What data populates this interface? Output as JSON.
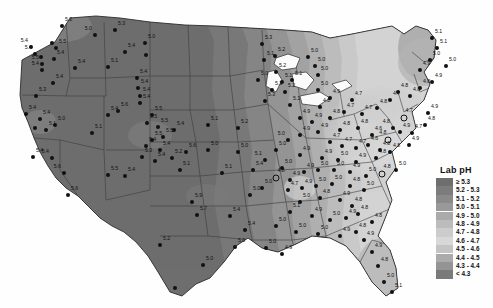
{
  "figure": {
    "type": "choropleth-contour-map",
    "region": "Contiguous United States",
    "variable": "Lab pH",
    "background_color": "#ffffff"
  },
  "legend": {
    "title": "Lab pH",
    "position": "right",
    "classes": [
      {
        "label": "≥ 5.3",
        "color": "#6e6e6e"
      },
      {
        "label": "5.2 - 5.3",
        "color": "#7c7c7c"
      },
      {
        "label": "5.1 - 5.2",
        "color": "#8a8a8a"
      },
      {
        "label": "5.0 - 5.1",
        "color": "#999999"
      },
      {
        "label": "4.9 - 5.0",
        "color": "#aaaaaa"
      },
      {
        "label": "4.8 - 4.9",
        "color": "#bcbcbc"
      },
      {
        "label": "4.7 - 4.8",
        "color": "#cccccc"
      },
      {
        "label": "4.6 - 4.7",
        "color": "#d8d8d8"
      },
      {
        "label": "4.5 - 4.6",
        "color": "#c4c4c4"
      },
      {
        "label": "4.4 - 4.5",
        "color": "#ababab"
      },
      {
        "label": "4.3 - 4.4",
        "color": "#949494"
      },
      {
        "label": "< 4.3",
        "color": "#7a7a7a"
      }
    ]
  },
  "chart_data": {
    "type": "map",
    "title": "Lab pH",
    "value_range": [
      4.3,
      5.3
    ],
    "marker_types": {
      "filled_dot": "monitoring station",
      "open_circle": "highlighted monitoring station"
    },
    "stations": [
      {
        "x": 31,
        "y": 47,
        "v": "5.4",
        "m": "dot",
        "p": "lf"
      },
      {
        "x": 35,
        "y": 54,
        "v": "5.4",
        "m": "dot",
        "p": "lf"
      },
      {
        "x": 41,
        "y": 57,
        "v": "",
        "m": "dot",
        "p": "r"
      },
      {
        "x": 62,
        "y": 26,
        "v": "5.2",
        "m": "dot",
        "p": "r"
      },
      {
        "x": 52,
        "y": 43,
        "v": "",
        "m": "dot",
        "p": "r"
      },
      {
        "x": 56,
        "y": 48,
        "v": "5.5",
        "m": "dot",
        "p": "r"
      },
      {
        "x": 54,
        "y": 59,
        "v": "5.4",
        "m": "dot",
        "p": "r"
      },
      {
        "x": 95,
        "y": 35,
        "v": "5.0",
        "m": "dot",
        "p": "lf"
      },
      {
        "x": 115,
        "y": 30,
        "v": "5.3",
        "m": "dot",
        "p": "r"
      },
      {
        "x": 145,
        "y": 43,
        "v": "5.0",
        "m": "dot",
        "p": "r"
      },
      {
        "x": 125,
        "y": 52,
        "v": "5.4",
        "m": "dot",
        "p": "r"
      },
      {
        "x": 146,
        "y": 55,
        "v": "",
        "m": "dot",
        "p": "r"
      },
      {
        "x": 42,
        "y": 64,
        "v": "5.5",
        "m": "dot",
        "p": "lf"
      },
      {
        "x": 42,
        "y": 70,
        "v": "5.4",
        "m": "dot",
        "p": "lf"
      },
      {
        "x": 75,
        "y": 68,
        "v": "5.4",
        "m": "dot",
        "p": "r"
      },
      {
        "x": 108,
        "y": 67,
        "v": "5.1",
        "m": "dot",
        "p": "r"
      },
      {
        "x": 53,
        "y": 83,
        "v": "5.4",
        "m": "dot",
        "p": "r"
      },
      {
        "x": 36,
        "y": 96,
        "v": "5.3",
        "m": "dot",
        "p": "r"
      },
      {
        "x": 137,
        "y": 78,
        "v": "5.4",
        "m": "dot",
        "p": "r"
      },
      {
        "x": 138,
        "y": 88,
        "v": "5.4",
        "m": "dot",
        "p": "r"
      },
      {
        "x": 140,
        "y": 96,
        "v": "5.4",
        "m": "dot",
        "p": "r"
      },
      {
        "x": 140,
        "y": 103,
        "v": "5.4",
        "m": "dot",
        "p": "r"
      },
      {
        "x": 26,
        "y": 114,
        "v": "5.4",
        "m": "dot",
        "p": "r"
      },
      {
        "x": 40,
        "y": 119,
        "v": "5.4",
        "m": "dot",
        "p": "r"
      },
      {
        "x": 35,
        "y": 128,
        "v": "",
        "m": "dot",
        "p": "r"
      },
      {
        "x": 46,
        "y": 130,
        "v": "5.1",
        "m": "dot",
        "p": "r"
      },
      {
        "x": 55,
        "y": 125,
        "v": "5.0",
        "m": "dot",
        "p": "r"
      },
      {
        "x": 33,
        "y": 157,
        "v": "5.4",
        "m": "dot",
        "p": "r"
      },
      {
        "x": 52,
        "y": 158,
        "v": "5.4",
        "m": "dot",
        "p": "lf"
      },
      {
        "x": 92,
        "y": 133,
        "v": "5.1",
        "m": "dot",
        "p": "r"
      },
      {
        "x": 108,
        "y": 175,
        "v": "5.5",
        "m": "dot",
        "p": "r"
      },
      {
        "x": 64,
        "y": 173,
        "v": "5.6",
        "m": "dot",
        "p": "lf"
      },
      {
        "x": 68,
        "y": 195,
        "v": "5.6",
        "m": "dot",
        "p": "r"
      },
      {
        "x": 108,
        "y": 115,
        "v": "5.4",
        "m": "dot",
        "p": "r"
      },
      {
        "x": 118,
        "y": 111,
        "v": "5.6",
        "m": "dot",
        "p": "r"
      },
      {
        "x": 152,
        "y": 115,
        "v": "5.5",
        "m": "dot",
        "p": "r"
      },
      {
        "x": 147,
        "y": 123,
        "v": "5.5",
        "m": "dot",
        "p": "r"
      },
      {
        "x": 158,
        "y": 127,
        "v": "5.5",
        "m": "dot",
        "p": "r"
      },
      {
        "x": 174,
        "y": 130,
        "v": "5.4",
        "m": "dot",
        "p": "r"
      },
      {
        "x": 163,
        "y": 137,
        "v": "5.5",
        "m": "dot",
        "p": "r"
      },
      {
        "x": 152,
        "y": 140,
        "v": "5.5",
        "m": "dot",
        "p": "r"
      },
      {
        "x": 146,
        "y": 146,
        "v": "5.4",
        "m": "dot",
        "p": "r"
      },
      {
        "x": 160,
        "y": 150,
        "v": "5.4",
        "m": "dot",
        "p": "r"
      },
      {
        "x": 142,
        "y": 157,
        "v": "5.3",
        "m": "dot",
        "p": "r"
      },
      {
        "x": 155,
        "y": 161,
        "v": "5.4",
        "m": "dot",
        "p": "r"
      },
      {
        "x": 172,
        "y": 158,
        "v": "5.2",
        "m": "dot",
        "p": "r"
      },
      {
        "x": 186,
        "y": 152,
        "v": "5.6",
        "m": "dot",
        "p": "r"
      },
      {
        "x": 208,
        "y": 125,
        "v": "5.1",
        "m": "dot",
        "p": "r"
      },
      {
        "x": 238,
        "y": 128,
        "v": "5.2",
        "m": "dot",
        "p": "r"
      },
      {
        "x": 208,
        "y": 150,
        "v": "5.0",
        "m": "dot",
        "p": "r"
      },
      {
        "x": 238,
        "y": 152,
        "v": "5.0",
        "m": "dot",
        "p": "r"
      },
      {
        "x": 125,
        "y": 176,
        "v": "5.4",
        "m": "dot",
        "p": "r"
      },
      {
        "x": 180,
        "y": 170,
        "v": "5.1",
        "m": "dot",
        "p": "r"
      },
      {
        "x": 222,
        "y": 173,
        "v": "5.1",
        "m": "dot",
        "p": "r"
      },
      {
        "x": 253,
        "y": 170,
        "v": "5.4",
        "m": "dot",
        "p": "r"
      },
      {
        "x": 250,
        "y": 195,
        "v": "5.0",
        "m": "dot",
        "p": "r"
      },
      {
        "x": 192,
        "y": 202,
        "v": "5.9",
        "m": "dot",
        "p": "r"
      },
      {
        "x": 197,
        "y": 215,
        "v": "5.7",
        "m": "dot",
        "p": "r"
      },
      {
        "x": 230,
        "y": 216,
        "v": "5.4",
        "m": "dot",
        "p": "r"
      },
      {
        "x": 245,
        "y": 230,
        "v": "5.4",
        "m": "dot",
        "p": "r"
      },
      {
        "x": 235,
        "y": 247,
        "v": "5.0",
        "m": "dot",
        "p": "r"
      },
      {
        "x": 203,
        "y": 265,
        "v": "5.0",
        "m": "dot",
        "p": "r"
      },
      {
        "x": 160,
        "y": 245,
        "v": "5.2",
        "m": "dot",
        "p": "r"
      },
      {
        "x": 175,
        "y": 288,
        "v": "",
        "m": "dot",
        "p": "r"
      },
      {
        "x": 262,
        "y": 44,
        "v": "5.3",
        "m": "dot",
        "p": "r"
      },
      {
        "x": 264,
        "y": 60,
        "v": "5.1",
        "m": "dot",
        "p": "r"
      },
      {
        "x": 275,
        "y": 56,
        "v": "5.2",
        "m": "dot",
        "p": "r"
      },
      {
        "x": 276,
        "y": 72,
        "v": "5.2",
        "m": "dot",
        "p": "r"
      },
      {
        "x": 282,
        "y": 82,
        "v": "5.1",
        "m": "dot",
        "p": "r"
      },
      {
        "x": 292,
        "y": 80,
        "v": "5.1",
        "m": "dot",
        "p": "r"
      },
      {
        "x": 258,
        "y": 80,
        "v": "5.0",
        "m": "dot",
        "p": "r"
      },
      {
        "x": 272,
        "y": 90,
        "v": "5.3",
        "m": "dot",
        "p": "r"
      },
      {
        "x": 285,
        "y": 92,
        "v": "5.2",
        "m": "dot",
        "p": "r"
      },
      {
        "x": 265,
        "y": 101,
        "v": "5.3",
        "m": "dot",
        "p": "r"
      },
      {
        "x": 290,
        "y": 105,
        "v": "5.1",
        "m": "dot",
        "p": "r"
      },
      {
        "x": 308,
        "y": 57,
        "v": "5.0",
        "m": "dot",
        "p": "r"
      },
      {
        "x": 315,
        "y": 66,
        "v": "5.0",
        "m": "dot",
        "p": "r"
      },
      {
        "x": 318,
        "y": 75,
        "v": "5.0",
        "m": "dot",
        "p": "r"
      },
      {
        "x": 318,
        "y": 90,
        "v": "5.0",
        "m": "dot",
        "p": "r"
      },
      {
        "x": 330,
        "y": 98,
        "v": "4.9",
        "m": "dot",
        "p": "r"
      },
      {
        "x": 320,
        "y": 107,
        "v": "4.8",
        "m": "dot",
        "p": "r"
      },
      {
        "x": 300,
        "y": 118,
        "v": "4.9",
        "m": "dot",
        "p": "r"
      },
      {
        "x": 312,
        "y": 122,
        "v": "4.9",
        "m": "dot",
        "p": "r"
      },
      {
        "x": 330,
        "y": 118,
        "v": "4.8",
        "m": "dot",
        "p": "r"
      },
      {
        "x": 352,
        "y": 100,
        "v": "4.7",
        "m": "dot",
        "p": "r"
      },
      {
        "x": 344,
        "y": 112,
        "v": "4.7",
        "m": "dot",
        "p": "r"
      },
      {
        "x": 362,
        "y": 114,
        "v": "4.7",
        "m": "dot",
        "p": "r"
      },
      {
        "x": 377,
        "y": 108,
        "v": "4.8",
        "m": "dot",
        "p": "r"
      },
      {
        "x": 390,
        "y": 100,
        "v": "4.7",
        "m": "dot",
        "p": "r"
      },
      {
        "x": 398,
        "y": 92,
        "v": "4.8",
        "m": "dot",
        "p": "r"
      },
      {
        "x": 410,
        "y": 96,
        "v": "4.8",
        "m": "dot",
        "p": "r"
      },
      {
        "x": 420,
        "y": 88,
        "v": "4.8",
        "m": "dot",
        "p": "r"
      },
      {
        "x": 432,
        "y": 82,
        "v": "4.9",
        "m": "dot",
        "p": "r"
      },
      {
        "x": 420,
        "y": 70,
        "v": "4.9",
        "m": "dot",
        "p": "r"
      },
      {
        "x": 430,
        "y": 60,
        "v": "5.0",
        "m": "dot",
        "p": "r"
      },
      {
        "x": 437,
        "y": 48,
        "v": "5.1",
        "m": "dot",
        "p": "r"
      },
      {
        "x": 432,
        "y": 38,
        "v": "5.1",
        "m": "dot",
        "p": "r"
      },
      {
        "x": 446,
        "y": 66,
        "v": "5.0",
        "m": "dot",
        "p": "r"
      },
      {
        "x": 404,
        "y": 118,
        "v": "4.7",
        "m": "ring",
        "p": "r"
      },
      {
        "x": 393,
        "y": 128,
        "v": "4.8",
        "m": "dot",
        "p": "lf"
      },
      {
        "x": 400,
        "y": 132,
        "v": "4.9",
        "m": "dot",
        "p": "r"
      },
      {
        "x": 388,
        "y": 140,
        "v": "4.8",
        "m": "ring",
        "p": "lf"
      },
      {
        "x": 380,
        "y": 150,
        "v": "4.8",
        "m": "dot",
        "p": "r"
      },
      {
        "x": 412,
        "y": 133,
        "v": "4.7",
        "m": "dot",
        "p": "r"
      },
      {
        "x": 425,
        "y": 125,
        "v": "4.8",
        "m": "dot",
        "p": "r"
      },
      {
        "x": 428,
        "y": 113,
        "v": "4.9",
        "m": "dot",
        "p": "r"
      },
      {
        "x": 300,
        "y": 135,
        "v": "4.9",
        "m": "dot",
        "p": "r"
      },
      {
        "x": 318,
        "y": 132,
        "v": "4.9",
        "m": "dot",
        "p": "r"
      },
      {
        "x": 340,
        "y": 130,
        "v": "4.8",
        "m": "dot",
        "p": "r"
      },
      {
        "x": 358,
        "y": 128,
        "v": "4.8",
        "m": "dot",
        "p": "r"
      },
      {
        "x": 372,
        "y": 135,
        "v": "4.6",
        "m": "dot",
        "p": "r"
      },
      {
        "x": 368,
        "y": 145,
        "v": "4.6",
        "m": "dot",
        "p": "r"
      },
      {
        "x": 356,
        "y": 148,
        "v": "4.7",
        "m": "dot",
        "p": "r"
      },
      {
        "x": 342,
        "y": 146,
        "v": "4.7",
        "m": "dot",
        "p": "r"
      },
      {
        "x": 330,
        "y": 142,
        "v": "4.7",
        "m": "dot",
        "p": "r"
      },
      {
        "x": 288,
        "y": 140,
        "v": "5.0",
        "m": "dot",
        "p": "lf"
      },
      {
        "x": 276,
        "y": 150,
        "v": "5.0",
        "m": "dot",
        "p": "r"
      },
      {
        "x": 265,
        "y": 160,
        "v": "5.1",
        "m": "dot",
        "p": "lf"
      },
      {
        "x": 300,
        "y": 155,
        "v": "4.9",
        "m": "dot",
        "p": "r"
      },
      {
        "x": 322,
        "y": 158,
        "v": "4.9",
        "m": "dot",
        "p": "r"
      },
      {
        "x": 338,
        "y": 160,
        "v": "5.0",
        "m": "dot",
        "p": "r"
      },
      {
        "x": 356,
        "y": 162,
        "v": "4.9",
        "m": "dot",
        "p": "r"
      },
      {
        "x": 376,
        "y": 158,
        "v": "4.8",
        "m": "dot",
        "p": "r"
      },
      {
        "x": 390,
        "y": 152,
        "v": "4.8",
        "m": "dot",
        "p": "r"
      },
      {
        "x": 409,
        "y": 145,
        "v": "4.9",
        "m": "dot",
        "p": "r"
      },
      {
        "x": 282,
        "y": 168,
        "v": "5.0",
        "m": "dot",
        "p": "r"
      },
      {
        "x": 276,
        "y": 178,
        "v": "4.8",
        "m": "ring",
        "p": "r"
      },
      {
        "x": 290,
        "y": 180,
        "v": "4.9",
        "m": "dot",
        "p": "r"
      },
      {
        "x": 304,
        "y": 172,
        "v": "4.9",
        "m": "dot",
        "p": "r"
      },
      {
        "x": 318,
        "y": 170,
        "v": "5.0",
        "m": "dot",
        "p": "r"
      },
      {
        "x": 334,
        "y": 170,
        "v": "5.0",
        "m": "dot",
        "p": "r"
      },
      {
        "x": 350,
        "y": 172,
        "v": "4.9",
        "m": "dot",
        "p": "r"
      },
      {
        "x": 366,
        "y": 176,
        "v": "5.0",
        "m": "dot",
        "p": "r"
      },
      {
        "x": 382,
        "y": 174,
        "v": "4.8",
        "m": "ring",
        "p": "r"
      },
      {
        "x": 396,
        "y": 170,
        "v": "5.0",
        "m": "dot",
        "p": "r"
      },
      {
        "x": 262,
        "y": 188,
        "v": "5.0",
        "m": "dot",
        "p": "r"
      },
      {
        "x": 288,
        "y": 190,
        "v": "4.7",
        "m": "dot",
        "p": "r"
      },
      {
        "x": 302,
        "y": 188,
        "v": "4.9",
        "m": "dot",
        "p": "r"
      },
      {
        "x": 316,
        "y": 186,
        "v": "5.0",
        "m": "dot",
        "p": "r"
      },
      {
        "x": 332,
        "y": 184,
        "v": "5.0",
        "m": "dot",
        "p": "r"
      },
      {
        "x": 350,
        "y": 186,
        "v": "4.8",
        "m": "dot",
        "p": "r"
      },
      {
        "x": 364,
        "y": 190,
        "v": "5.0",
        "m": "dot",
        "p": "r"
      },
      {
        "x": 300,
        "y": 202,
        "v": "5.0",
        "m": "dot",
        "p": "r"
      },
      {
        "x": 320,
        "y": 198,
        "v": "4.8",
        "m": "dot",
        "p": "r"
      },
      {
        "x": 340,
        "y": 200,
        "v": "4.9",
        "m": "dot",
        "p": "r"
      },
      {
        "x": 352,
        "y": 206,
        "v": "4.8",
        "m": "dot",
        "p": "r"
      },
      {
        "x": 290,
        "y": 212,
        "v": "5.1",
        "m": "dot",
        "p": "r"
      },
      {
        "x": 312,
        "y": 216,
        "v": "4.9",
        "m": "dot",
        "p": "r"
      },
      {
        "x": 330,
        "y": 220,
        "v": "5.0",
        "m": "dot",
        "p": "r"
      },
      {
        "x": 346,
        "y": 218,
        "v": "4.9",
        "m": "dot",
        "p": "r"
      },
      {
        "x": 358,
        "y": 214,
        "v": "4.8",
        "m": "dot",
        "p": "r"
      },
      {
        "x": 276,
        "y": 226,
        "v": "5.0",
        "m": "dot",
        "p": "r"
      },
      {
        "x": 296,
        "y": 232,
        "v": "5.0",
        "m": "dot",
        "p": "r"
      },
      {
        "x": 318,
        "y": 234,
        "v": "5.0",
        "m": "dot",
        "p": "r"
      },
      {
        "x": 340,
        "y": 236,
        "v": "4.9",
        "m": "dot",
        "p": "r"
      },
      {
        "x": 356,
        "y": 232,
        "v": "4.8",
        "m": "dot",
        "p": "r"
      },
      {
        "x": 372,
        "y": 222,
        "v": "4.8",
        "m": "dot",
        "p": "r"
      },
      {
        "x": 266,
        "y": 248,
        "v": "5.0",
        "m": "dot",
        "p": "r"
      },
      {
        "x": 282,
        "y": 254,
        "v": "4.9",
        "m": "dot",
        "p": "r"
      },
      {
        "x": 372,
        "y": 252,
        "v": "4.9",
        "m": "dot",
        "p": "r"
      },
      {
        "x": 378,
        "y": 266,
        "v": "4.8",
        "m": "dot",
        "p": "r"
      },
      {
        "x": 384,
        "y": 282,
        "v": "5.0",
        "m": "dot",
        "p": "r"
      },
      {
        "x": 392,
        "y": 292,
        "v": "5.1",
        "m": "dot",
        "p": "r"
      },
      {
        "x": 364,
        "y": 240,
        "v": "4.9",
        "m": "dot",
        "p": "r"
      }
    ]
  }
}
